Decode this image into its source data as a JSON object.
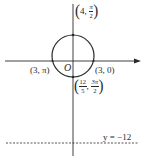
{
  "figure": {
    "type": "polar coordinate diagram",
    "origin_label": "O",
    "curve": "circle",
    "colors": {
      "stroke": "#2a2a2a",
      "background": "#ffffff"
    }
  },
  "points": {
    "top": {
      "r": "4",
      "theta_num": "π",
      "theta_den": "2"
    },
    "left": {
      "text": "(3, π)"
    },
    "right": {
      "text": "(3, 0)"
    },
    "bottom": {
      "r_num": "12",
      "r_den": "5",
      "theta_num": "3π",
      "theta_den": "2"
    }
  },
  "directrix": {
    "label": "y = −12",
    "style": "dashed"
  },
  "punct": {
    "open": "(",
    "close": ")",
    "comma": ","
  }
}
